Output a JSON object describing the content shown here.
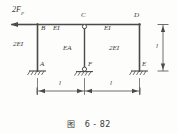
{
  "figure": {
    "caption_prefix": "图",
    "caption_number": "6 - 82",
    "load_label": "2F",
    "load_sub": "P",
    "joints": {
      "a": "A",
      "b": "B",
      "c": "C",
      "d": "D",
      "e": "E",
      "f": "F"
    },
    "members": {
      "left_column": "2EI",
      "left_beam": "EI",
      "middle_column": "EA",
      "right_beam": "EI",
      "right_column": "2EI"
    },
    "dimensions": {
      "span_left": "l",
      "span_right": "l",
      "height": "l"
    },
    "colors": {
      "line": "#4a4a4a",
      "text": "#3a3a3a",
      "background": "#fdfdfb"
    }
  }
}
